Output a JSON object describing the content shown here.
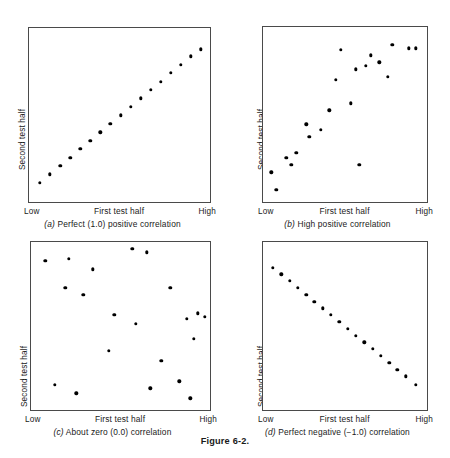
{
  "figure": {
    "caption": "Figure 6-2.",
    "axis": {
      "y_label": "Second test half",
      "x_label": "First test half",
      "x_low": "Low",
      "x_high": "High"
    }
  },
  "chart_data": [
    {
      "type": "scatter",
      "id": "panel-a",
      "panel_letter": "(a)",
      "caption": "(a) Perfect (1.0) positive correlation",
      "caption_text": " Perfect (1.0) positive correlation",
      "title": "Perfect (1.0) positive correlation",
      "correlation": 1.0,
      "xlabel": "First test half",
      "ylabel": "Second test half",
      "xticklabels": [
        "Low",
        "High"
      ],
      "yticklabels": [],
      "xlim": [
        0,
        100
      ],
      "ylim": [
        0,
        100
      ],
      "grid": false,
      "legend": "none",
      "n_points": 17,
      "x": [
        6,
        11.5,
        17,
        22.5,
        28,
        33.5,
        39,
        44.5,
        50,
        55.5,
        61,
        66.5,
        72,
        77.5,
        83,
        88.5,
        94
      ],
      "y": [
        12,
        16.8,
        21.6,
        26.4,
        31.2,
        36,
        40.8,
        45.6,
        50.4,
        55.2,
        60,
        64.8,
        69.6,
        74.4,
        79.2,
        84,
        88
      ]
    },
    {
      "type": "scatter",
      "id": "panel-b",
      "panel_letter": "(b)",
      "caption": "(b) High positive correlation",
      "caption_text": " High positive correlation",
      "title": "High positive correlation",
      "correlation": 0.8,
      "xlabel": "First test half",
      "ylabel": "Second test half",
      "xticklabels": [
        "Low",
        "High"
      ],
      "yticklabels": [],
      "xlim": [
        0,
        100
      ],
      "ylim": [
        0,
        100
      ],
      "grid": false,
      "legend": "none",
      "n_points": 20,
      "x": [
        5,
        8,
        14,
        17,
        20,
        26,
        28,
        35,
        40,
        44,
        47,
        53,
        56,
        58,
        62,
        65,
        70,
        75,
        78,
        88,
        92
      ],
      "y": [
        18,
        8,
        26,
        22,
        29,
        45,
        38,
        42,
        53,
        70,
        87,
        57,
        76,
        22,
        78,
        84,
        80,
        72,
        90,
        88,
        88
      ]
    },
    {
      "type": "scatter",
      "id": "panel-c",
      "panel_letter": "(c)",
      "caption": "(c) About zero (0.0) correlation",
      "caption_text": " About zero (0.0) correlation",
      "title": "About zero (0.0) correlation",
      "correlation": 0.0,
      "xlabel": "First test half",
      "ylabel": "Second test half",
      "xticklabels": [
        "Low",
        "High"
      ],
      "yticklabels": [],
      "xlim": [
        0,
        100
      ],
      "ylim": [
        0,
        100
      ],
      "grid": false,
      "legend": "none",
      "n_points": 21,
      "x": [
        8,
        13,
        19,
        21,
        25,
        29,
        34,
        43,
        46,
        56,
        58,
        64,
        66,
        72,
        77,
        82,
        86,
        88,
        90,
        92,
        96
      ],
      "y": [
        89,
        16,
        73,
        90,
        11,
        69,
        84,
        36,
        57,
        96,
        52,
        94,
        14,
        30,
        73,
        18,
        55,
        8,
        43,
        58,
        56
      ]
    },
    {
      "type": "scatter",
      "id": "panel-d",
      "panel_letter": "(d)",
      "caption": "(d) Perfect negative (−1.0) correlation",
      "caption_text": " Perfect negative (−1.0) correlation",
      "title": "Perfect negative (−1.0) correlation",
      "correlation": -1.0,
      "xlabel": "First test half",
      "ylabel": "Second test half",
      "xticklabels": [
        "Low",
        "High"
      ],
      "yticklabels": [],
      "xlim": [
        0,
        100
      ],
      "ylim": [
        0,
        100
      ],
      "grid": false,
      "legend": "none",
      "n_points": 18,
      "x": [
        6,
        11,
        16,
        21,
        26,
        31,
        36,
        41,
        46,
        51,
        56,
        61,
        66,
        71,
        76,
        81,
        86,
        92
      ],
      "y": [
        85,
        81,
        77,
        73,
        69,
        65,
        61,
        57,
        53,
        49,
        45,
        41,
        37,
        33,
        29,
        25,
        21,
        16
      ]
    }
  ]
}
